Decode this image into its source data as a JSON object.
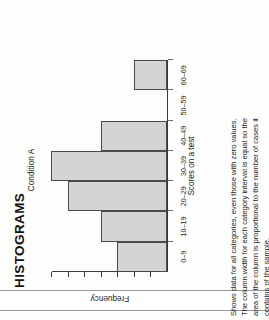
{
  "page": {
    "title": "HISTOGRAMS"
  },
  "caption": {
    "lines": [
      "Shows data for all categories, even those with zero values.",
      "The column width for each category interval is equal so the",
      "area of the column is proportional to the number of cases it",
      "contains of the sample."
    ]
  },
  "chart_data": {
    "type": "bar",
    "title": "Condition A",
    "xlabel": "Scores on a test",
    "ylabel": "Frequency",
    "categories": [
      "0–9",
      "10–19",
      "20–29",
      "30–39",
      "40–49",
      "50–59",
      "60–69"
    ],
    "values": [
      3,
      4,
      6,
      7,
      4,
      0,
      2
    ],
    "ylim": [
      0,
      7
    ],
    "yticks": [
      0,
      1,
      2,
      3,
      4,
      5,
      6,
      7
    ],
    "ytick_labels": [
      "",
      "",
      "",
      "",
      "",
      "",
      "",
      ""
    ],
    "grid": false,
    "legend": false,
    "bar_fill": "#d4d4d4",
    "bar_stroke": "#4a4a4a",
    "axis_color": "#3a3a3a"
  }
}
